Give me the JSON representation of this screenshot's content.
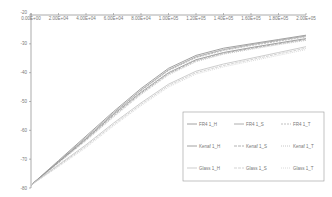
{
  "chart_data": {
    "type": "line",
    "title": "",
    "xlabel": "",
    "ylabel": "",
    "xlim": [
      0,
      200000
    ],
    "ylim": [
      -80,
      -20
    ],
    "grid": false,
    "legend_position": "lower-right inside",
    "x_tick_labels": [
      "0.00E+00",
      "2.00E+04",
      "4.00E+04",
      "6.00E+04",
      "8.00E+04",
      "1.00E+05",
      "1.20E+05",
      "1.40E+05",
      "1.60E+05",
      "1.80E+05",
      "2.00E+05"
    ],
    "y_tick_labels": [
      "-20",
      "-30",
      "-40",
      "-50",
      "-60",
      "-70",
      "-80"
    ],
    "x": [
      0,
      20000,
      40000,
      60000,
      80000,
      100000,
      120000,
      140000,
      160000,
      180000,
      200000
    ],
    "series": [
      {
        "name": "FR4 1_H",
        "color": "#8a8a8a",
        "values": [
          -79,
          -70.5,
          -62,
          -53.5,
          -45.5,
          -38.5,
          -34,
          -31.5,
          -30,
          -28.5,
          -27
        ]
      },
      {
        "name": "FR4 1_S",
        "color": "#9a9a9a",
        "values": [
          -79,
          -70.8,
          -62.5,
          -54,
          -46,
          -39,
          -34.5,
          -32,
          -30.3,
          -28.8,
          -27.3
        ]
      },
      {
        "name": "FR4 1_T",
        "color": "#b0b0b0",
        "values": [
          -79,
          -71,
          -62.8,
          -54.3,
          -46.3,
          -39.3,
          -34.8,
          -32.3,
          -30.6,
          -29.1,
          -27.6
        ]
      },
      {
        "name": "Kenaf 1_H",
        "color": "#8c8c8c",
        "values": [
          -79,
          -71,
          -63,
          -54.5,
          -46.8,
          -40,
          -35.5,
          -33,
          -31.3,
          -29.7,
          -28.2
        ]
      },
      {
        "name": "Kenaf 1_S",
        "color": "#a0a0a0",
        "values": [
          -79,
          -71.2,
          -63.3,
          -55,
          -47.2,
          -40.4,
          -35.8,
          -33.3,
          -31.6,
          -30,
          -28.5
        ]
      },
      {
        "name": "Kenaf 1_T",
        "color": "#b8b8b8",
        "values": [
          -79,
          -71.4,
          -63.6,
          -55.4,
          -47.6,
          -40.8,
          -36.2,
          -33.6,
          -31.9,
          -30.3,
          -28.8
        ]
      },
      {
        "name": "Glass 1_H",
        "color": "#c0c0c0",
        "values": [
          -79,
          -72,
          -65,
          -57.5,
          -50.5,
          -44,
          -39.5,
          -37,
          -35,
          -33,
          -31
        ]
      },
      {
        "name": "Glass 1_S",
        "color": "#c8c8c8",
        "values": [
          -79,
          -72.3,
          -65.5,
          -58,
          -51,
          -44.5,
          -40,
          -37.5,
          -35.5,
          -33.5,
          -31.5
        ]
      },
      {
        "name": "Glass 1_T",
        "color": "#d0d0d0",
        "values": [
          -79,
          -72.6,
          -66,
          -58.5,
          -51.5,
          -45,
          -40.5,
          -38,
          -36,
          -34,
          -32
        ]
      }
    ]
  }
}
